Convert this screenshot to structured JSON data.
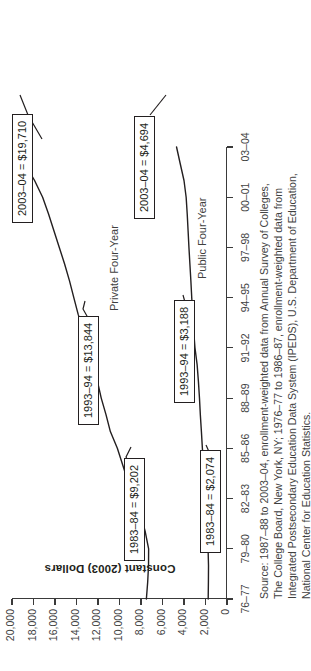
{
  "chart_data": {
    "type": "line",
    "title": "",
    "xlabel": "",
    "ylabel": "Constant (2003) Dollars",
    "x": [
      "76–77",
      "79–80",
      "82–83",
      "85–86",
      "88–89",
      "91–92",
      "94–95",
      "97–98",
      "00–01",
      "03–04"
    ],
    "ylim": [
      0,
      20000
    ],
    "ytick_labels": [
      "20,000",
      "18,000",
      "16,000",
      "14,000",
      "12,000",
      "10,000",
      "8,000",
      "6,000",
      "4,000",
      "2,000",
      "0"
    ],
    "ytick_values": [
      20000,
      18000,
      16000,
      14000,
      12000,
      10000,
      8000,
      6000,
      4000,
      2000,
      0
    ],
    "grid": false,
    "legend_position": "inline-labels",
    "series": [
      {
        "name": "Private Four-Year",
        "x": [
          "76–77",
          "77–78",
          "78–79",
          "79–80",
          "80–81",
          "81–82",
          "82–83",
          "83–84",
          "84–85",
          "85–86",
          "86–87",
          "87–88",
          "88–89",
          "89–90",
          "90–91",
          "91–92",
          "92–93",
          "93–94",
          "94–95",
          "95–96",
          "96–97",
          "97–98",
          "98–99",
          "99–00",
          "00–01",
          "01–02",
          "02–03",
          "03–04"
        ],
        "values": [
          7500,
          7380,
          7300,
          7290,
          7600,
          8000,
          8620,
          9202,
          9700,
          10200,
          10850,
          11250,
          11700,
          12050,
          12400,
          12950,
          13350,
          13844,
          14250,
          14650,
          15100,
          15600,
          16100,
          16600,
          17150,
          17900,
          18800,
          19710
        ]
      },
      {
        "name": "Public Four-Year",
        "x": [
          "76–77",
          "77–78",
          "78–79",
          "79–80",
          "80–81",
          "81–82",
          "82–83",
          "83–84",
          "84–85",
          "85–86",
          "86–87",
          "87–88",
          "88–89",
          "89–90",
          "90–91",
          "91–92",
          "92–93",
          "93–94",
          "94–95",
          "95–96",
          "96–97",
          "97–98",
          "98–99",
          "99–00",
          "00–01",
          "01–02",
          "02–03",
          "03–04"
        ],
        "values": [
          1750,
          1730,
          1720,
          1760,
          1810,
          1900,
          1990,
          2074,
          2180,
          2290,
          2380,
          2480,
          2560,
          2660,
          2780,
          2980,
          3100,
          3188,
          3280,
          3360,
          3450,
          3540,
          3620,
          3700,
          3800,
          4000,
          4350,
          4694
        ]
      }
    ],
    "annotations": [
      {
        "id": "private-1983",
        "series": "Private Four-Year",
        "label": "1983–84 = $9,202",
        "x": "83–84",
        "value": 9202
      },
      {
        "id": "private-1993",
        "series": "Private Four-Year",
        "label": "1993–94 = $13,844",
        "x": "93–94",
        "value": 13844
      },
      {
        "id": "private-2003",
        "series": "Private Four-Year",
        "label": "2003–04 = $19,710",
        "x": "03–04",
        "value": 19710
      },
      {
        "id": "public-1983",
        "series": "Public Four-Year",
        "label": "1983–84 = $2,074",
        "x": "83–84",
        "value": 2074
      },
      {
        "id": "public-1993",
        "series": "Public Four-Year",
        "label": "1993–94 = $3,188",
        "x": "93–94",
        "value": 3188
      },
      {
        "id": "public-2003",
        "series": "Public Four-Year",
        "label": "2003–04 = $4,694",
        "x": "03–04",
        "value": 4694
      }
    ],
    "source_lines": [
      "Source: 1987–88 to 2003–04, enrollment-weighted data from Annual Survey of Colleges,",
      "The College Board, New York, NY; 1976–77 to 1986–87, enrollment-weighted data from",
      "Integrated Postsecondary Education Data System (IPEDS), U.S. Department of Education,",
      "National Center for Education Statistics."
    ]
  },
  "colors": {
    "line": "#231f20",
    "axis": "#3a3a3a",
    "text": "#3f3f3f",
    "background": "#ffffff"
  }
}
